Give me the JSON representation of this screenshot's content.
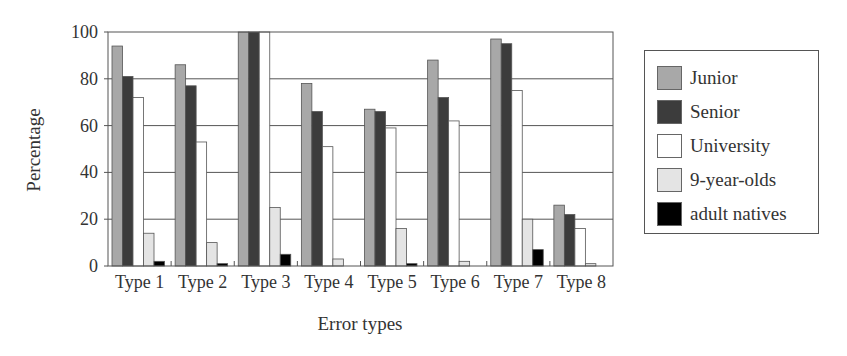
{
  "chart_data": {
    "type": "bar",
    "title": "",
    "xlabel": "Error types",
    "ylabel": "Percentage",
    "ylim": [
      0,
      100
    ],
    "yticks": [
      0,
      20,
      40,
      60,
      80,
      100
    ],
    "grid": true,
    "legend_position": "right",
    "categories": [
      "Type 1",
      "Type 2",
      "Type 3",
      "Type 4",
      "Type 5",
      "Type 6",
      "Type 7",
      "Type 8"
    ],
    "series": [
      {
        "name": "Junior",
        "color": "#a8a8a8",
        "values": [
          94,
          86,
          100,
          78,
          67,
          88,
          97,
          26
        ]
      },
      {
        "name": "Senior",
        "color": "#3c3c3c",
        "values": [
          81,
          77,
          100,
          66,
          66,
          72,
          95,
          22
        ]
      },
      {
        "name": "University",
        "color": "#ffffff",
        "values": [
          72,
          53,
          100,
          51,
          59,
          62,
          75,
          16
        ]
      },
      {
        "name": "9-year-olds",
        "color": "#e4e4e4",
        "values": [
          14,
          10,
          25,
          3,
          16,
          2,
          20,
          1
        ]
      },
      {
        "name": "adult natives",
        "color": "#000000",
        "values": [
          2,
          1,
          5,
          0,
          1,
          0,
          7,
          0
        ]
      }
    ]
  }
}
